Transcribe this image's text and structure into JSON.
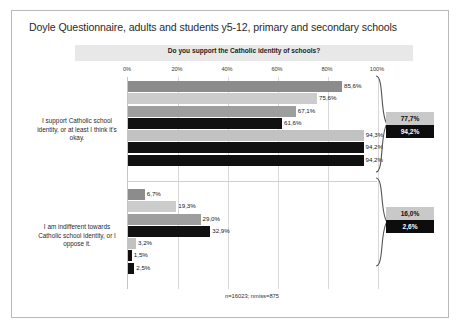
{
  "slide": {
    "title": "Doyle Questionnaire, adults and students y5-12, primary and secondary schools"
  },
  "chart_data": {
    "type": "bar",
    "orientation": "horizontal",
    "title": "Do you support the Catholic identity of schools?",
    "xlabel": "",
    "ylabel": "",
    "xlim": [
      0,
      100
    ],
    "xticks": [
      "0%",
      "20%",
      "40%",
      "60%",
      "80%",
      "100%"
    ],
    "xtick_values": [
      0,
      20,
      40,
      60,
      80,
      100
    ],
    "grid": true,
    "legend": "none",
    "footnote": "n=16023; nmiss=875",
    "categories": [
      "I support Catholic school identity, or at least I think it's okay.",
      "I am indifferent towards Catholic school identity, or I oppose it."
    ],
    "groups": [
      {
        "name": "I support Catholic school identity, or at least I think it's okay.",
        "summary_light": "77,7%",
        "summary_dark": "94,2%",
        "bars": [
          {
            "label": "85,6%",
            "value": 85.6,
            "color": "#8c8c8c",
            "label_inside": false
          },
          {
            "label": "75,6%",
            "value": 75.6,
            "color": "#cccccc",
            "label_inside": false
          },
          {
            "label": "67,1%",
            "value": 67.1,
            "color": "#9e9e9e",
            "label_inside": false
          },
          {
            "label": "61,6%",
            "value": 61.6,
            "color": "#111111",
            "label_inside": false
          },
          {
            "label": "94,3%",
            "value": 94.3,
            "color": "#c2c2c2",
            "label_inside": false
          },
          {
            "label": "94,2%",
            "value": 94.2,
            "color": "#101010",
            "label_inside": false
          },
          {
            "label": "94,2%",
            "value": 94.2,
            "color": "#101010",
            "label_inside": false
          }
        ]
      },
      {
        "name": "I am indifferent towards Catholic school identity, or I oppose it.",
        "summary_light": "16,0%",
        "summary_dark": "2,6%",
        "bars": [
          {
            "label": "6,7%",
            "value": 6.7,
            "color": "#8c8c8c",
            "label_inside": false
          },
          {
            "label": "19,3%",
            "value": 19.3,
            "color": "#cccccc",
            "label_inside": false
          },
          {
            "label": "29,0%",
            "value": 29.0,
            "color": "#9e9e9e",
            "label_inside": false
          },
          {
            "label": "32,9%",
            "value": 32.9,
            "color": "#111111",
            "label_inside": false
          },
          {
            "label": "3,2%",
            "value": 3.2,
            "color": "#c2c2c2",
            "label_inside": false
          },
          {
            "label": "1,5%",
            "value": 1.5,
            "color": "#101010",
            "label_inside": false
          },
          {
            "label": "2,5%",
            "value": 2.5,
            "color": "#101010",
            "label_inside": false
          }
        ]
      }
    ]
  }
}
